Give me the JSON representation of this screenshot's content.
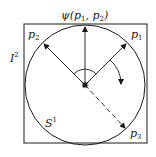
{
  "diagram": {
    "labels": {
      "psi": "ψ(p",
      "psi_sub1": "1",
      "psi_mid": ", p",
      "psi_sub2": "2",
      "psi_close": ")",
      "p1": "p",
      "p1_sub": "1",
      "p2": "p",
      "p2_sub": "2",
      "p3": "p",
      "p3_sub": "3",
      "I": "I",
      "I_sup": "2",
      "S": "S",
      "S_sup": "1"
    },
    "colors": {
      "stroke": "#1a1a1a",
      "background": "#ffffff"
    }
  }
}
